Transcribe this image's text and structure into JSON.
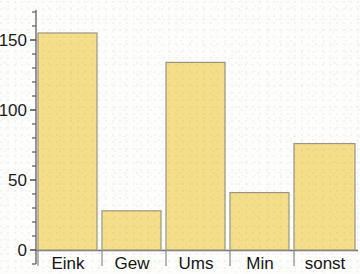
{
  "chart_data": {
    "type": "bar",
    "title": "",
    "subtitle": "",
    "xlabel": "",
    "ylabel": "",
    "categories": [
      "Eink",
      "Gew",
      "Ums",
      "Min",
      "sonst"
    ],
    "values": [
      155,
      28,
      134,
      41,
      76
    ],
    "series": [
      {
        "name": "",
        "values": [
          155,
          28,
          134,
          41,
          76
        ]
      }
    ],
    "ylim": [
      0,
      168
    ],
    "xlim": [
      0,
      5
    ],
    "y_ticks": [
      0,
      50,
      100,
      150
    ],
    "y_tick_labels": [
      "0",
      "50",
      "100",
      "150"
    ],
    "y_minor_tick_step": 10,
    "grid": false,
    "legend": false,
    "legend_position": "none",
    "bar_fill_color": "#f5de8a",
    "bar_edge_color": "#9c9482",
    "axis_color": "#7d7d7d",
    "text_color": "#1b1b1b",
    "background_color": "#fdfdfc",
    "annotations": []
  },
  "axis": {
    "y_labels": [
      "150",
      "100",
      "50",
      "0"
    ],
    "x_labels": [
      "Eink",
      "Gew",
      "Ums",
      "Min",
      "sonst"
    ]
  }
}
